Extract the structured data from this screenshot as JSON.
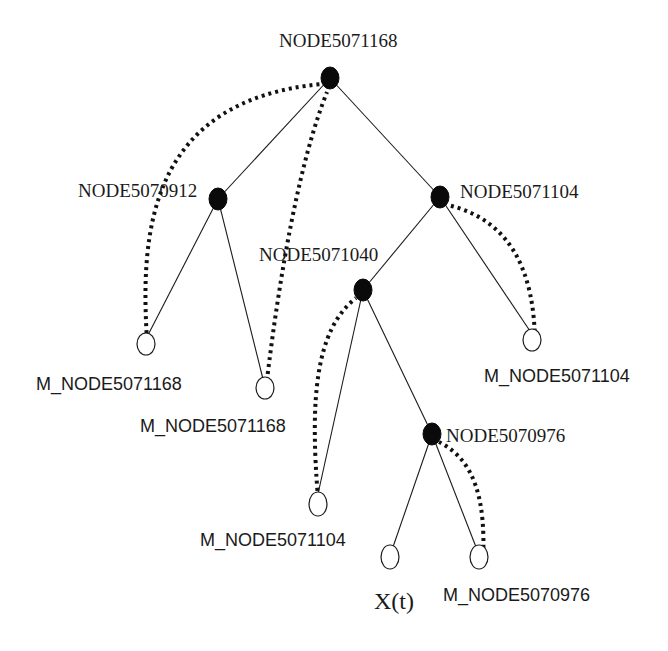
{
  "diagram": {
    "type": "tree",
    "nodes": {
      "root": {
        "label": "NODE5071168",
        "kind": "internal"
      },
      "n912": {
        "label": "NODE5070912",
        "kind": "internal"
      },
      "n1104": {
        "label": "NODE5071104",
        "kind": "internal"
      },
      "n1040": {
        "label": "NODE5071040",
        "kind": "internal"
      },
      "n976": {
        "label": "NODE5070976",
        "kind": "internal"
      },
      "m1168a": {
        "label": "M_NODE5071168",
        "kind": "leaf"
      },
      "m1168b": {
        "label": "M_NODE5071168",
        "kind": "leaf"
      },
      "m1104a": {
        "label": "M_NODE5071104",
        "kind": "leaf"
      },
      "m1104b": {
        "label": "M_NODE5071104",
        "kind": "leaf"
      },
      "xt": {
        "label": "X(t)",
        "kind": "leaf"
      },
      "m976": {
        "label": "M_NODE5070976",
        "kind": "leaf"
      }
    },
    "edges": [
      [
        "root",
        "n912"
      ],
      [
        "root",
        "n1104"
      ],
      [
        "n912",
        "m1168a"
      ],
      [
        "n912",
        "m1168b"
      ],
      [
        "n1104",
        "n1040"
      ],
      [
        "n1104",
        "m1104a"
      ],
      [
        "n1040",
        "m1104b"
      ],
      [
        "n1040",
        "n976"
      ],
      [
        "n976",
        "xt"
      ],
      [
        "n976",
        "m976"
      ]
    ],
    "pointers": [
      [
        "m1168a",
        "root"
      ],
      [
        "m1168b",
        "root"
      ],
      [
        "m1104a",
        "n1104"
      ],
      [
        "m1104b",
        "n1040"
      ],
      [
        "m976",
        "n976"
      ]
    ]
  }
}
